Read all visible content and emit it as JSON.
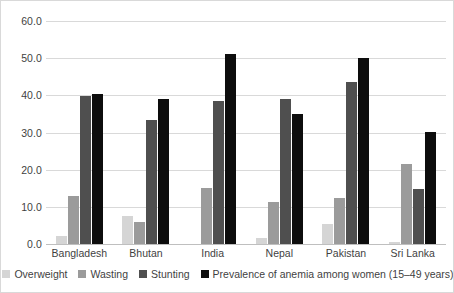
{
  "chart_data": {
    "type": "bar",
    "title": "",
    "subtitle": "",
    "xlabel": "",
    "ylabel": "",
    "ylim": [
      0,
      60
    ],
    "ytick_labels": [
      "0.0",
      "10.0",
      "20.0",
      "30.0",
      "40.0",
      "50.0",
      "60.0"
    ],
    "ytick_values": [
      0,
      10,
      20,
      30,
      40,
      50,
      60
    ],
    "grid": true,
    "legend_position": "bottom",
    "categories": [
      "Bangladesh",
      "Bhutan",
      "India",
      "Nepal",
      "Pakistan",
      "Sri Lanka"
    ],
    "series": [
      {
        "name": "Overweight",
        "color": "#d5d5d5",
        "values": [
          2.2,
          7.6,
          0.0,
          1.6,
          5.3,
          0.5
        ]
      },
      {
        "name": "Wasting",
        "color": "#9b9b9b",
        "values": [
          13.0,
          5.9,
          15.0,
          11.3,
          12.5,
          21.4
        ]
      },
      {
        "name": "Stunting",
        "color": "#4f4f4f",
        "values": [
          39.8,
          33.4,
          38.5,
          39.0,
          43.7,
          14.7
        ]
      },
      {
        "name": "Prevalence of anemia among women (15–49 years)",
        "color": "#0d0d0d",
        "values": [
          40.4,
          39.0,
          51.2,
          35.0,
          50.0,
          30.1
        ]
      }
    ]
  },
  "style": {
    "gridline_color": "#d9d9d9",
    "axis_color": "#bfbfbf",
    "text_color": "#3f3f3f",
    "background": "#ffffff"
  }
}
